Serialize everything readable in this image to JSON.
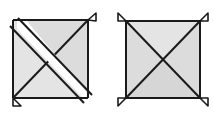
{
  "canvas": {
    "width": 214,
    "height": 116,
    "background_color": "#ffffff"
  },
  "style": {
    "fill_color": "#dcdcdc",
    "fill_color_light": "#e4e4e4",
    "stroke_color": "#1a1a1a",
    "band_color": "#ffffff",
    "stroke_width": 2.0,
    "thin_stroke_width": 1.6
  },
  "figures": [
    {
      "id": "left-figure",
      "name": "square-with-offset-diagonal-band",
      "description": "Square with both diagonals; the top-left to bottom-right diagonal is drawn as a wide white band splitting the square, with corner flaps at top-right and bottom-left.",
      "square": {
        "x": 13,
        "y": 20,
        "width": 75,
        "height": 78
      },
      "diagonals": [
        "top-left-to-bottom-right",
        "top-right-to-bottom-left"
      ],
      "band": {
        "present": true,
        "orientation": "top-left-to-bottom-right",
        "color": "#ffffff",
        "width": 9
      },
      "flaps": [
        {
          "corner": "top-right",
          "direction": "up-right"
        },
        {
          "corner": "bottom-left",
          "direction": "down-left"
        }
      ]
    },
    {
      "id": "right-figure",
      "name": "square-with-crossed-diagonals",
      "description": "Square with both diagonals forming an X, with small triangular flaps at all four corners.",
      "square": {
        "x": 126,
        "y": 21,
        "width": 74,
        "height": 77
      },
      "diagonals": [
        "top-left-to-bottom-right",
        "top-right-to-bottom-left"
      ],
      "band": {
        "present": false
      },
      "flaps": [
        {
          "corner": "top-left",
          "direction": "up-left"
        },
        {
          "corner": "top-right",
          "direction": "up-right"
        },
        {
          "corner": "bottom-left",
          "direction": "down-left"
        },
        {
          "corner": "bottom-right",
          "direction": "down-right"
        }
      ]
    }
  ]
}
